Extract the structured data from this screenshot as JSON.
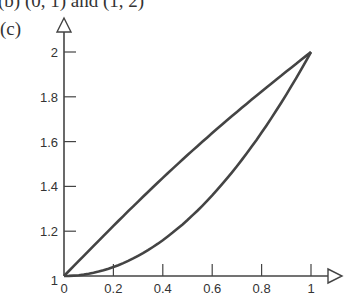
{
  "captions": {
    "top": "(b)  (0, 1) and (1, 2)",
    "label": "(c)"
  },
  "colors": {
    "line": "#444444",
    "axis": "#444444"
  },
  "chart_data": {
    "type": "line",
    "title": "",
    "xlabel": "",
    "ylabel": "",
    "xlim": [
      0,
      1
    ],
    "ylim": [
      1,
      2
    ],
    "xticks": [
      "0",
      "0.2",
      "0.4",
      "0.6",
      "0.8",
      "1"
    ],
    "yticks": [
      "1",
      "1.2",
      "1.4",
      "1.6",
      "1.8",
      "2"
    ],
    "series": [
      {
        "name": "upper (y = 1 + x)",
        "x": [
          0,
          0.2,
          0.4,
          0.6,
          0.8,
          1
        ],
        "values": [
          1,
          1.2,
          1.4,
          1.6,
          1.8,
          2
        ]
      },
      {
        "name": "lower (y = 1 + x^2)",
        "x": [
          0,
          0.2,
          0.4,
          0.6,
          0.8,
          1
        ],
        "values": [
          1,
          1.04,
          1.16,
          1.36,
          1.64,
          2
        ]
      }
    ],
    "grid": false,
    "legend": "none"
  }
}
